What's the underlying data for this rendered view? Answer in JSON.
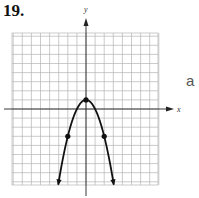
{
  "problem_number": "19.",
  "side_label": "a",
  "chart_data": {
    "type": "line",
    "title": "",
    "xlabel": "x",
    "ylabel": "y",
    "function": "y = -x^2 + 1",
    "grid": true,
    "xlim": [
      -8,
      8
    ],
    "ylim": [
      -8.5,
      8.5
    ],
    "points": [
      {
        "x": -2,
        "y": -3
      },
      {
        "x": 0,
        "y": 1
      },
      {
        "x": 2,
        "y": -3
      }
    ],
    "curve_extends_with_arrows": true,
    "line_color": "#111111",
    "grid_color": "#b5b5b5"
  }
}
